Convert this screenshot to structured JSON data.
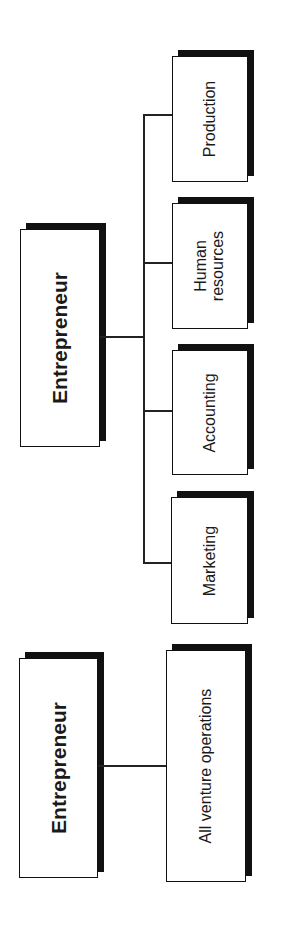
{
  "top_chart": {
    "root": {
      "label": "Entrepreneur"
    },
    "departments": [
      {
        "label": "Production"
      },
      {
        "label": "Human\nresources"
      },
      {
        "label": "Accounting"
      },
      {
        "label": "Marketing"
      }
    ]
  },
  "bottom_chart": {
    "root": {
      "label": "Entrepreneur"
    },
    "child": {
      "label": "All venture operations"
    }
  },
  "colors": {
    "line": "#111111",
    "box_fill": "#ffffff",
    "shadow": "#111111"
  }
}
